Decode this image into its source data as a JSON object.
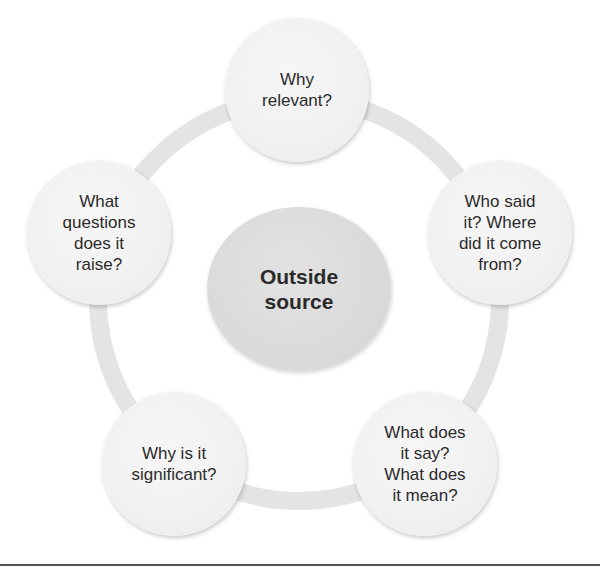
{
  "diagram": {
    "type": "cycle",
    "center": {
      "label": "Outside\nsource"
    },
    "nodes": [
      {
        "id": "top",
        "label": "Why\nrelevant?"
      },
      {
        "id": "right",
        "label": "Who said\nit? Where\ndid it come\nfrom?"
      },
      {
        "id": "bottom-right",
        "label": "What does\nit say?\nWhat does\nit mean?"
      },
      {
        "id": "bottom-left",
        "label": "Why is it\nsignificant?"
      },
      {
        "id": "left",
        "label": "What\nquestions\ndoes it\nraise?"
      }
    ]
  },
  "colors": {
    "ring": "#e4e4e4",
    "outer_node_fill": "#f1f1f1",
    "center_node_fill": "#dadada",
    "text": "#2b2b2b",
    "bottom_rule": "#555555"
  }
}
